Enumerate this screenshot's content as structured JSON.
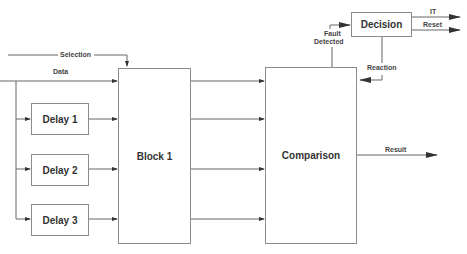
{
  "blocks": {
    "delay1": "Delay 1",
    "delay2": "Delay 2",
    "delay3": "Delay 3",
    "block1": "Block 1",
    "comparison": "Comparison",
    "decision": "Decision"
  },
  "signals": {
    "selection": "Selection",
    "data": "Data",
    "fault_detected_line1": "Fault",
    "fault_detected_line2": "Detected",
    "reaction": "Reaction",
    "it": "IT",
    "reset": "Reset",
    "result": "Result"
  },
  "colors": {
    "line": "#555555",
    "box_border": "#8c8c8c",
    "text": "#333333"
  }
}
